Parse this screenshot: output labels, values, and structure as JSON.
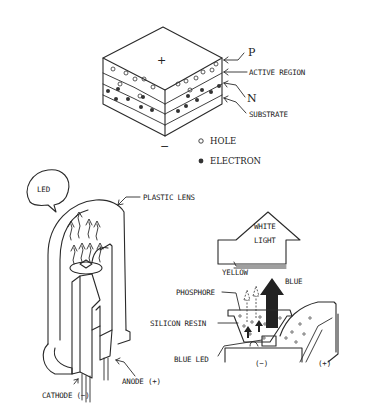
{
  "diagram": {
    "junction": {
      "top_sign": "+",
      "bottom_sign": "−",
      "labels": {
        "p": "P",
        "active": "ACTIVE REGION",
        "n": "N",
        "substrate": "SUBSTRATE"
      },
      "legend": {
        "hole": "HOLE",
        "electron": "ELECTRON"
      }
    },
    "led": {
      "bubble": "LED",
      "lens": "PLASTIC LENS",
      "cathode": "CATHODE (−)",
      "anode": "ANODE (+)"
    },
    "white_led": {
      "white1": "WHITE",
      "white2": "LIGHT",
      "yellow": "YELLOW",
      "blue": "BLUE",
      "phosphore": "PHOSPHORE",
      "resin": "SILICON RESIN",
      "blue_led": "BLUE LED",
      "minus": "(−)",
      "plus": "(+)"
    }
  }
}
